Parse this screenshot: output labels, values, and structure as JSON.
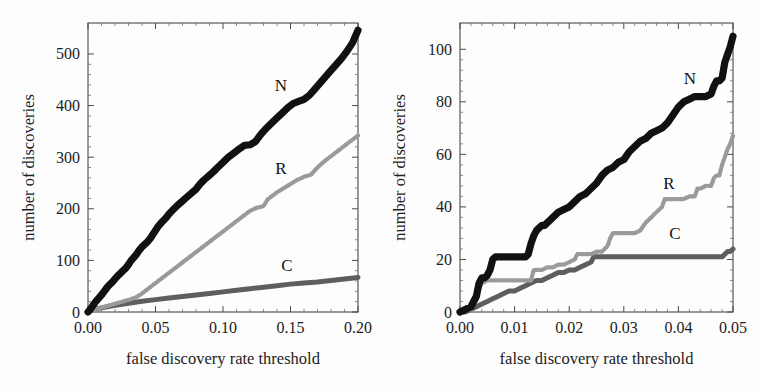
{
  "figure": {
    "panels": [
      {
        "id": "left",
        "xlabel": "false discovery rate threshold",
        "ylabel": "number of discoveries",
        "xticks": [
          "0.00",
          "0.05",
          "0.10",
          "0.15",
          "0.20"
        ],
        "yticks": [
          "0",
          "100",
          "200",
          "300",
          "400",
          "500"
        ],
        "series_labels": {
          "N": "N",
          "R": "R",
          "C": "C"
        }
      },
      {
        "id": "right",
        "xlabel": "false discovery rate threshold",
        "ylabel": "number of discoveries",
        "xticks": [
          "0.00",
          "0.01",
          "0.02",
          "0.03",
          "0.04",
          "0.05"
        ],
        "yticks": [
          "0",
          "20",
          "40",
          "60",
          "80",
          "100"
        ],
        "series_labels": {
          "N": "N",
          "R": "R",
          "C": "C"
        }
      }
    ]
  },
  "colors": {
    "N": "#111111",
    "R": "#9a9a9a",
    "C": "#5e5e5e",
    "axis": "#4a4a4a",
    "text": "#1c1c1c",
    "background": "#fdfdfd"
  },
  "chart_data": [
    {
      "type": "line",
      "panel": "left",
      "title": "",
      "xlabel": "false discovery rate threshold",
      "ylabel": "number of discoveries",
      "xlim": [
        0.0,
        0.2
      ],
      "ylim": [
        0,
        560
      ],
      "xticks": [
        0.0,
        0.05,
        0.1,
        0.15,
        0.2
      ],
      "yticks": [
        0,
        100,
        200,
        300,
        400,
        500
      ],
      "grid": false,
      "legend": "inline-annotations",
      "series": [
        {
          "name": "N",
          "color": "#111111",
          "x": [
            0.0,
            0.002,
            0.004,
            0.006,
            0.008,
            0.01,
            0.012,
            0.014,
            0.016,
            0.018,
            0.02,
            0.022,
            0.024,
            0.026,
            0.028,
            0.03,
            0.032,
            0.034,
            0.036,
            0.038,
            0.04,
            0.042,
            0.044,
            0.046,
            0.048,
            0.05,
            0.052,
            0.055,
            0.058,
            0.06,
            0.063,
            0.066,
            0.07,
            0.073,
            0.076,
            0.08,
            0.083,
            0.086,
            0.09,
            0.093,
            0.096,
            0.1,
            0.104,
            0.108,
            0.112,
            0.116,
            0.12,
            0.124,
            0.128,
            0.132,
            0.136,
            0.14,
            0.144,
            0.148,
            0.152,
            0.156,
            0.16,
            0.164,
            0.168,
            0.172,
            0.176,
            0.18,
            0.184,
            0.188,
            0.192,
            0.196,
            0.2
          ],
          "y": [
            0,
            6,
            14,
            21,
            27,
            33,
            40,
            47,
            53,
            58,
            64,
            70,
            75,
            80,
            85,
            92,
            100,
            106,
            112,
            120,
            126,
            131,
            136,
            142,
            150,
            158,
            166,
            175,
            183,
            190,
            198,
            206,
            215,
            222,
            229,
            238,
            248,
            256,
            265,
            272,
            280,
            290,
            300,
            308,
            316,
            323,
            324,
            330,
            344,
            356,
            366,
            376,
            386,
            396,
            404,
            408,
            412,
            420,
            432,
            444,
            456,
            468,
            480,
            492,
            506,
            522,
            546
          ]
        },
        {
          "name": "R",
          "color": "#9a9a9a",
          "x": [
            0.0,
            0.004,
            0.008,
            0.012,
            0.016,
            0.02,
            0.024,
            0.028,
            0.032,
            0.036,
            0.04,
            0.044,
            0.048,
            0.052,
            0.056,
            0.06,
            0.064,
            0.068,
            0.072,
            0.076,
            0.08,
            0.084,
            0.088,
            0.092,
            0.096,
            0.1,
            0.105,
            0.11,
            0.115,
            0.12,
            0.125,
            0.13,
            0.133,
            0.136,
            0.14,
            0.145,
            0.15,
            0.155,
            0.16,
            0.165,
            0.17,
            0.175,
            0.18,
            0.185,
            0.19,
            0.195,
            0.2
          ],
          "y": [
            0,
            3,
            7,
            10,
            13,
            16,
            19,
            22,
            25,
            29,
            36,
            44,
            52,
            60,
            68,
            76,
            84,
            92,
            100,
            108,
            116,
            124,
            132,
            140,
            148,
            156,
            166,
            176,
            186,
            196,
            202,
            205,
            218,
            224,
            232,
            240,
            248,
            256,
            262,
            266,
            280,
            292,
            302,
            312,
            322,
            332,
            342
          ]
        },
        {
          "name": "C",
          "color": "#5e5e5e",
          "x": [
            0.0,
            0.004,
            0.008,
            0.012,
            0.016,
            0.02,
            0.025,
            0.03,
            0.035,
            0.04,
            0.05,
            0.06,
            0.07,
            0.08,
            0.09,
            0.1,
            0.11,
            0.12,
            0.13,
            0.14,
            0.15,
            0.16,
            0.17,
            0.18,
            0.19,
            0.2
          ],
          "y": [
            0,
            4,
            7,
            9,
            11,
            13,
            15,
            17,
            19,
            21,
            24,
            27,
            30,
            33,
            36,
            39,
            42,
            45,
            48,
            51,
            54,
            56,
            58,
            61,
            64,
            67
          ]
        }
      ]
    },
    {
      "type": "line",
      "panel": "right",
      "title": "",
      "xlabel": "false discovery rate threshold",
      "ylabel": "number of discoveries",
      "xlim": [
        0.0,
        0.05
      ],
      "ylim": [
        0,
        110
      ],
      "xticks": [
        0.0,
        0.01,
        0.02,
        0.03,
        0.04,
        0.05
      ],
      "yticks": [
        0,
        20,
        40,
        60,
        80,
        100
      ],
      "grid": false,
      "legend": "inline-annotations",
      "series": [
        {
          "name": "N",
          "color": "#111111",
          "x": [
            0.0,
            0.002,
            0.003,
            0.0035,
            0.004,
            0.0045,
            0.005,
            0.0055,
            0.006,
            0.0065,
            0.007,
            0.008,
            0.009,
            0.01,
            0.011,
            0.012,
            0.0125,
            0.013,
            0.0135,
            0.014,
            0.0145,
            0.015,
            0.0155,
            0.016,
            0.0165,
            0.017,
            0.0175,
            0.018,
            0.019,
            0.02,
            0.021,
            0.022,
            0.023,
            0.024,
            0.025,
            0.026,
            0.027,
            0.028,
            0.029,
            0.03,
            0.031,
            0.032,
            0.033,
            0.034,
            0.035,
            0.036,
            0.037,
            0.038,
            0.039,
            0.04,
            0.0405,
            0.041,
            0.042,
            0.043,
            0.044,
            0.045,
            0.046,
            0.0465,
            0.047,
            0.0475,
            0.048,
            0.0485,
            0.049,
            0.0495,
            0.05
          ],
          "y": [
            0,
            2,
            6,
            11,
            13,
            13,
            14,
            16,
            20,
            21,
            21,
            21,
            21,
            21,
            21,
            21,
            22,
            26,
            29,
            31,
            32,
            33,
            33,
            34,
            35,
            36,
            37,
            38,
            39,
            40,
            42,
            44,
            45,
            47,
            49,
            52,
            54,
            55,
            57,
            58,
            61,
            63,
            65,
            66,
            68,
            69,
            70,
            72,
            75,
            78,
            79,
            80,
            81,
            82,
            82,
            82,
            83,
            86,
            88,
            88,
            89,
            95,
            98,
            101,
            105
          ]
        },
        {
          "name": "R",
          "color": "#9a9a9a",
          "x": [
            0.0,
            0.002,
            0.003,
            0.0035,
            0.004,
            0.005,
            0.006,
            0.007,
            0.008,
            0.009,
            0.01,
            0.011,
            0.012,
            0.013,
            0.0135,
            0.014,
            0.015,
            0.016,
            0.017,
            0.018,
            0.019,
            0.02,
            0.021,
            0.0215,
            0.022,
            0.023,
            0.024,
            0.025,
            0.026,
            0.027,
            0.0275,
            0.028,
            0.029,
            0.03,
            0.031,
            0.032,
            0.033,
            0.034,
            0.035,
            0.036,
            0.037,
            0.0375,
            0.038,
            0.039,
            0.04,
            0.041,
            0.042,
            0.043,
            0.0435,
            0.044,
            0.045,
            0.046,
            0.0465,
            0.047,
            0.0475,
            0.048,
            0.0485,
            0.049,
            0.0495,
            0.05
          ],
          "y": [
            0,
            1,
            5,
            9,
            11,
            12,
            12,
            12,
            12,
            12,
            12,
            12,
            12,
            12,
            16,
            16,
            16,
            17,
            17,
            18,
            18,
            19,
            20,
            22,
            22,
            22,
            22,
            23,
            23,
            25,
            28,
            30,
            30,
            30,
            30,
            30,
            31,
            34,
            36,
            38,
            40,
            43,
            43,
            43,
            43,
            43,
            44,
            44,
            47,
            47,
            48,
            48,
            51,
            52,
            52,
            56,
            59,
            62,
            64,
            67
          ]
        },
        {
          "name": "C",
          "color": "#5e5e5e",
          "x": [
            0.0,
            0.001,
            0.002,
            0.003,
            0.004,
            0.005,
            0.006,
            0.007,
            0.008,
            0.009,
            0.01,
            0.011,
            0.012,
            0.013,
            0.014,
            0.015,
            0.016,
            0.017,
            0.018,
            0.019,
            0.02,
            0.021,
            0.022,
            0.023,
            0.024,
            0.0245,
            0.025,
            0.027,
            0.03,
            0.033,
            0.036,
            0.039,
            0.042,
            0.045,
            0.047,
            0.048,
            0.0485,
            0.049,
            0.0495,
            0.05
          ],
          "y": [
            0,
            0,
            1,
            2,
            3,
            4,
            5,
            6,
            7,
            8,
            8,
            9,
            10,
            11,
            12,
            12,
            13,
            14,
            15,
            15,
            16,
            16,
            17,
            18,
            19,
            21,
            21,
            21,
            21,
            21,
            21,
            21,
            21,
            21,
            21,
            21,
            22,
            23,
            23,
            24
          ]
        }
      ]
    }
  ]
}
